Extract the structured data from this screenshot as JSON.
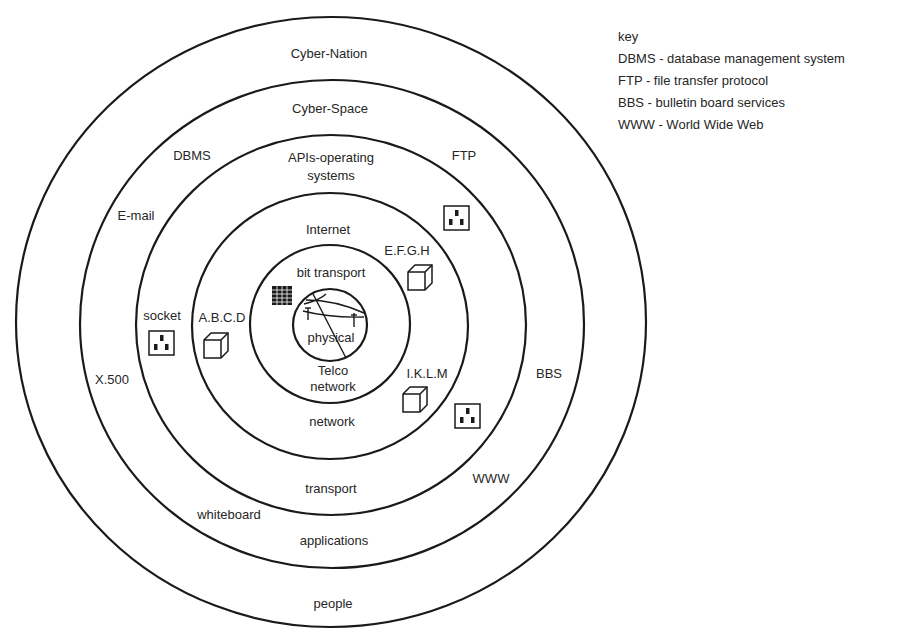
{
  "key": {
    "title": "key",
    "entries": [
      "DBMS - database management system",
      "FTP -  file transfer protocol",
      "BBS - bulletin board services",
      "WWW - World Wide Web"
    ]
  },
  "rings": [
    {
      "name": "Cyber-Nation",
      "cx": 331,
      "cy": 322,
      "rx": 315,
      "ry": 305
    },
    {
      "name": "Cyber-Space",
      "cx": 332,
      "cy": 324,
      "rx": 252,
      "ry": 244
    },
    {
      "name": "APIs-operating systems",
      "cx": 331,
      "cy": 325,
      "rx": 195,
      "ry": 190
    },
    {
      "name": "Internet",
      "cx": 330,
      "cy": 326,
      "rx": 138,
      "ry": 133
    },
    {
      "name": "bit transport",
      "cx": 330,
      "cy": 324,
      "rx": 80,
      "ry": 79
    },
    {
      "name": "physical",
      "cx": 330,
      "cy": 325,
      "rx": 37,
      "ry": 36
    }
  ],
  "labels": {
    "cyber_nation": "Cyber-Nation",
    "cyber_space": "Cyber-Space",
    "apis_line1": "APIs-operating",
    "apis_line2": "systems",
    "dbms": "DBMS",
    "ftp": "FTP",
    "email": "E-mail",
    "internet": "Internet",
    "efgh": "E.F.G.H",
    "bit_transport": "bit transport",
    "socket": "socket",
    "abcd": "A.B.C.D",
    "physical": "physical",
    "telco_line1": "Telco",
    "telco_line2": "network",
    "x500": "X.500",
    "iklm": "I.K.L.M",
    "bbs": "BBS",
    "network": "network",
    "www": "WWW",
    "transport": "transport",
    "whiteboard": "whiteboard",
    "applications": "applications",
    "people": "people"
  },
  "icons": {
    "sockets": [
      {
        "label": "socket-left",
        "x": 149,
        "y": 331
      },
      {
        "label": "socket-ftp",
        "x": 444,
        "y": 206
      },
      {
        "label": "socket-iklm",
        "x": 455,
        "y": 404
      }
    ],
    "cubes": [
      {
        "label": "A.B.C.D",
        "x": 204,
        "y": 333
      },
      {
        "label": "E.F.G.H",
        "x": 408,
        "y": 265
      },
      {
        "label": "I.K.L.M",
        "x": 403,
        "y": 387
      }
    ]
  }
}
